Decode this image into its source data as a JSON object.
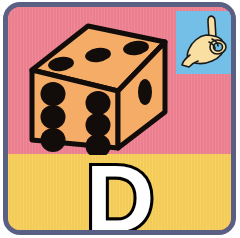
{
  "card": {
    "type": "alphabet-flashcard",
    "letter": "D",
    "word_illustrated": "dice",
    "border_color": "#5a6084",
    "top_panel_color": "#ef8292",
    "bottom_panel_color": "#f7cf5a",
    "sign_panel_color": "#74bfe8"
  },
  "illustration": {
    "name": "dice",
    "label": "die",
    "body_color": "#f5ac67",
    "outline_color": "#111111",
    "pip_color": "#111111",
    "faces": {
      "front": {
        "pips": 6,
        "layout": "2x3"
      },
      "top": {
        "pips": 3,
        "layout": "diagonal"
      },
      "right": {
        "pips": 1,
        "layout": "center"
      }
    }
  },
  "sign_language": {
    "name": "asl-hand-sign-d",
    "letter": "D",
    "description": "ASL fingerspelling hand shape for the letter D",
    "hand_color": "#f9dfa2",
    "outline_color": "#1a1a1a",
    "background_color": "#74bfe8"
  },
  "letter_display": {
    "character": "D",
    "fill_color": "#ffffff",
    "stroke_color": "#000000"
  }
}
